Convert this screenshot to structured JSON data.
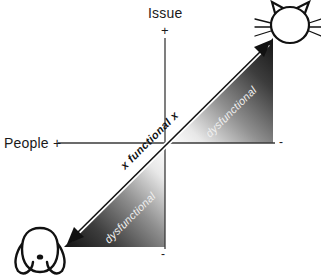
{
  "diagram": {
    "type": "quadrant-matrix",
    "axes": {
      "vertical": {
        "label": "Issue",
        "positive_sign": "+",
        "negative_sign": "-"
      },
      "horizontal": {
        "label": "People +",
        "positive_sign": "+",
        "negative_sign": "-"
      }
    },
    "diagonal": {
      "center_label": "x functional x",
      "upper_region_label": "dysfunctional",
      "lower_region_label": "dysfunctional",
      "arrow_style": "double-headed"
    },
    "icons": {
      "upper_right": "cat-icon",
      "lower_left": "dog-icon"
    },
    "colors": {
      "ink": "#1a1a1a",
      "axis": "#3a3a3a",
      "gradient_dark": "#1c1c1c",
      "gradient_light": "#ffffff",
      "dysfunctional_text": "#efefef",
      "background": "#ffffff"
    }
  }
}
